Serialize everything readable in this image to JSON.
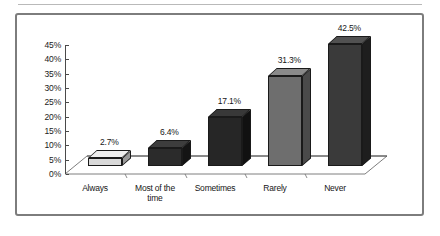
{
  "chart_data": {
    "type": "bar",
    "title": "",
    "subtitle": "",
    "xlabel": "",
    "ylabel": "",
    "categories": [
      "Always",
      "Most of the time",
      "Sometimes",
      "Rarely",
      "Never"
    ],
    "category_lines": [
      [
        "Always"
      ],
      [
        "Most of the",
        "time"
      ],
      [
        "Sometimes"
      ],
      [
        "Rarely"
      ],
      [
        "Never"
      ]
    ],
    "values": [
      2.7,
      6.4,
      17.1,
      31.3,
      42.5
    ],
    "value_labels": [
      "2.7%",
      "6.4%",
      "17.1%",
      "31.3%",
      "42.5%"
    ],
    "ylim": [
      0,
      45
    ],
    "ytick_values": [
      0,
      5,
      10,
      15,
      20,
      25,
      30,
      35,
      40,
      45
    ],
    "ytick_labels": [
      "0%",
      "5%",
      "10%",
      "15%",
      "20%",
      "25%",
      "30%",
      "35%",
      "40%",
      "45%"
    ],
    "grid": false,
    "legend": null,
    "style": "3d-column",
    "bar_colors": [
      "#d9d9d9",
      "#2b2b2b",
      "#262626",
      "#6e6e6e",
      "#3a3a3a"
    ],
    "bar_side_colors": [
      "#9a9a9a",
      "#141414",
      "#111111",
      "#4a4a4a",
      "#1e1e1e"
    ],
    "bar_top_colors": [
      "#efefef",
      "#3d3d3d",
      "#383838",
      "#8a8a8a",
      "#515151"
    ],
    "axis_color": "#4a4a4a",
    "frame_color": "#7d7d7d",
    "background": "#ffffff"
  }
}
